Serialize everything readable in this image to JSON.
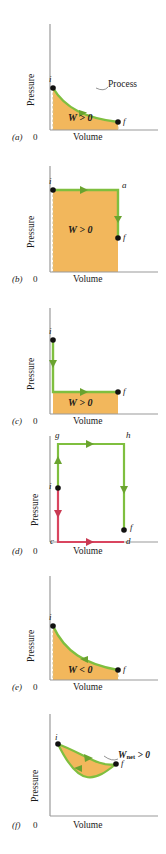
{
  "figure": {
    "type": "physics-pv-diagram-set",
    "panel_count": 6,
    "colors": {
      "fill": "#f2b75c",
      "process_green": "#7fbf3f",
      "process_green_dark": "#6aa32f",
      "process_red": "#d9455f",
      "axis": "#9a9a9a",
      "point": "#111111",
      "dashed": "#d8c08a"
    },
    "common": {
      "ylabel": "Pressure",
      "xlabel": "Volume",
      "origin": "0"
    }
  },
  "panels": [
    {
      "letter": "(a)",
      "ylabel": "Pressure",
      "xlabel": "Volume",
      "origin": "0",
      "work_label": "W > 0",
      "annotation": "Process",
      "points": [
        {
          "name": "i",
          "label": "i"
        },
        {
          "name": "f",
          "label": "f"
        }
      ],
      "path": "curve-down-right",
      "arrow_direction": "rightward",
      "shaded": true
    },
    {
      "letter": "(b)",
      "ylabel": "Pressure",
      "xlabel": "Volume",
      "origin": "0",
      "work_label": "W > 0",
      "annotation": "",
      "points": [
        {
          "name": "i",
          "label": "i"
        },
        {
          "name": "a",
          "label": "a"
        },
        {
          "name": "f",
          "label": "f"
        }
      ],
      "path": "right-then-down",
      "arrow_direction": "rightward-then-downward",
      "shaded": true
    },
    {
      "letter": "(c)",
      "ylabel": "Pressure",
      "xlabel": "Volume",
      "origin": "0",
      "work_label": "W > 0",
      "annotation": "",
      "points": [
        {
          "name": "i",
          "label": "i"
        },
        {
          "name": "f",
          "label": "f"
        }
      ],
      "path": "down-then-right",
      "arrow_direction": "downward-then-rightward",
      "shaded": true
    },
    {
      "letter": "(d)",
      "ylabel": "Pressure",
      "xlabel": "Volume",
      "origin": "0",
      "work_label": "",
      "annotation": "",
      "points": [
        {
          "name": "g",
          "label": "g"
        },
        {
          "name": "h",
          "label": "h"
        },
        {
          "name": "i",
          "label": "i"
        },
        {
          "name": "c",
          "label": "c"
        },
        {
          "name": "d",
          "label": "d"
        },
        {
          "name": "f",
          "label": "f"
        }
      ],
      "path": "two-routes-green-up-over-down-red-down-over",
      "arrow_direction": "mixed",
      "shaded": false
    },
    {
      "letter": "(e)",
      "ylabel": "Pressure",
      "xlabel": "Volume",
      "origin": "0",
      "work_label": "W < 0",
      "annotation": "",
      "points": [
        {
          "name": "i",
          "label": "i"
        },
        {
          "name": "f",
          "label": "f"
        }
      ],
      "path": "curve-down-right",
      "arrow_direction": "leftward",
      "shaded": true
    },
    {
      "letter": "(f)",
      "ylabel": "Pressure",
      "xlabel": "Volume",
      "origin": "0",
      "work_label": "",
      "annotation_main": "W",
      "annotation_sub": "net",
      "annotation_tail": " > 0",
      "points": [
        {
          "name": "i",
          "label": "i"
        },
        {
          "name": "f",
          "label": "f"
        }
      ],
      "path": "closed-cycle-lens",
      "arrow_direction": "clockwise",
      "shaded": true
    }
  ]
}
